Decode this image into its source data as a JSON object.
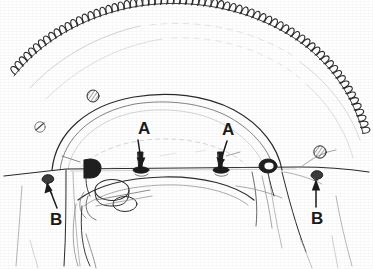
{
  "figure": {
    "style": "black-and-white scanned line drawing",
    "background_color": "#ffffff",
    "ink_color": "#1b1b1b",
    "width": 373,
    "height": 269
  },
  "callouts": [
    {
      "id": "a-left",
      "label": "A",
      "label_x": 145,
      "label_y": 132,
      "arrow_from_x": 138,
      "arrow_from_y": 140,
      "arrow_to_x": 141,
      "arrow_to_y": 166,
      "points_to": "mounting-bolt-left",
      "direction": "down"
    },
    {
      "id": "a-right",
      "label": "A",
      "label_x": 229,
      "label_y": 133,
      "arrow_from_x": 227,
      "arrow_from_y": 141,
      "arrow_to_x": 221,
      "arrow_to_y": 166,
      "points_to": "mounting-bolt-right",
      "direction": "down"
    },
    {
      "id": "b-left",
      "label": "B",
      "label_x": 57,
      "label_y": 223,
      "arrow_from_x": 57,
      "arrow_from_y": 208,
      "arrow_to_x": 49,
      "arrow_to_y": 184,
      "points_to": "retaining-screw-left",
      "direction": "up-left"
    },
    {
      "id": "b-right",
      "label": "B",
      "label_x": 318,
      "label_y": 222,
      "arrow_from_x": 316,
      "arrow_from_y": 207,
      "arrow_to_x": 316,
      "arrow_to_y": 180,
      "points_to": "retaining-screw-right",
      "direction": "up"
    }
  ],
  "parts": [
    {
      "id": "ring-gear",
      "name": "flywheel-ring-gear",
      "description": "toothed arc across top of figure"
    },
    {
      "id": "bell-housing-dome",
      "name": "bell-housing-dome",
      "description": "large central arc / dome outline"
    },
    {
      "id": "split-line",
      "name": "housing-split-line",
      "description": "horizontal parting line across full width"
    },
    {
      "id": "mounting-bolt-left",
      "name": "mounting-bolt",
      "description": "dark bolt with head on split line"
    },
    {
      "id": "mounting-bolt-right",
      "name": "mounting-bolt",
      "description": "dark bolt with head on split line"
    },
    {
      "id": "retaining-screw-left",
      "name": "retaining-screw",
      "description": "small screw head lower left"
    },
    {
      "id": "retaining-screw-right",
      "name": "retaining-screw",
      "description": "small screw head lower right"
    },
    {
      "id": "bracket-clip",
      "name": "bracket-clip",
      "description": "dark D-shaped clip on split line, left of centre"
    },
    {
      "id": "grommet-ring",
      "name": "grommet-ring",
      "description": "dark oval ring on split line, right of centre"
    },
    {
      "id": "bolt-hole-upper-left",
      "name": "hatched-bolt-head",
      "description": "small hatched circle upper left"
    },
    {
      "id": "bolt-hole-left",
      "name": "small-hole",
      "description": "small circle with slash, left"
    },
    {
      "id": "bolt-hole-right",
      "name": "hatched-bolt-head",
      "description": "small hatched circle right"
    },
    {
      "id": "oil-pan-lower",
      "name": "lower-housing-outline",
      "description": "lower pan / sump outlines"
    }
  ]
}
